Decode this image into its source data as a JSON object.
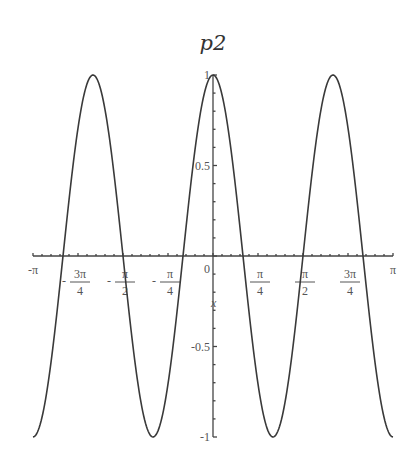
{
  "chart_data": {
    "type": "line",
    "title": "p2",
    "xlabel": "x",
    "ylabel": "",
    "xlim": [
      -3.14159265,
      3.14159265
    ],
    "ylim": [
      -1,
      1
    ],
    "grid": false,
    "legend": "none",
    "series": [
      {
        "name": "p2",
        "function": "cos(3x)",
        "samples": 400
      }
    ],
    "x_ticks": [
      {
        "value": -3.14159265,
        "label": "-π",
        "frac": false
      },
      {
        "value": -2.35619449,
        "label": "3π",
        "den": "4",
        "neg": true,
        "frac": true
      },
      {
        "value": -1.57079633,
        "label": "π",
        "den": "2",
        "neg": true,
        "frac": true
      },
      {
        "value": -0.78539816,
        "label": "π",
        "den": "4",
        "neg": true,
        "frac": true
      },
      {
        "value": 0.78539816,
        "label": "π",
        "den": "4",
        "neg": false,
        "frac": true
      },
      {
        "value": 1.57079633,
        "label": "π",
        "den": "2",
        "neg": false,
        "frac": true
      },
      {
        "value": 2.35619449,
        "label": "3π",
        "den": "4",
        "neg": false,
        "frac": true
      },
      {
        "value": 3.14159265,
        "label": "π",
        "frac": false
      }
    ],
    "origin_label": "0",
    "y_ticks": [
      {
        "value": 1,
        "label": "1"
      },
      {
        "value": 0.5,
        "label": "0.5"
      },
      {
        "value": -0.5,
        "label": "-0.5"
      },
      {
        "value": -1,
        "label": "-1"
      }
    ]
  }
}
